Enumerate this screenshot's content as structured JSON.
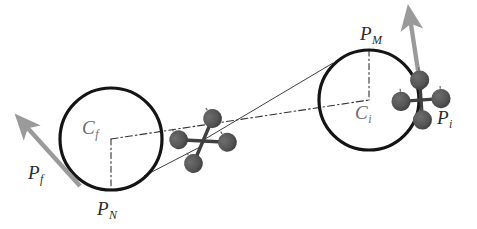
{
  "figure": {
    "background_color": "#ffffff",
    "stroke_color": "#1a1a1a",
    "arrow_color": "#9a9a9a",
    "rotor_color": "#555555",
    "label_color": "#2b2b2b"
  },
  "labels": {
    "c_f": {
      "base": "C",
      "sub": "f"
    },
    "p_f": {
      "base": "P",
      "sub": "f"
    },
    "p_n": {
      "base": "P",
      "sub": "N"
    },
    "p_m": {
      "base": "P",
      "sub": "M"
    },
    "c_i": {
      "base": "C",
      "sub": "i"
    },
    "p_i": {
      "base": "P",
      "sub": "i"
    }
  },
  "geometry": {
    "circle_final": {
      "cx": 111,
      "cy": 139,
      "r": 51,
      "label": "final turn circle"
    },
    "circle_initial": {
      "cx": 369,
      "cy": 100,
      "r": 50,
      "label": "initial turn circle"
    },
    "point_p_n": {
      "x": 111,
      "y": 190
    },
    "point_p_m": {
      "x": 369,
      "y": 50
    },
    "tangent_upper": {
      "x1": 203,
      "y1": 141,
      "x2": 330,
      "y2": 66
    },
    "tangent_lower": {
      "x1": 203,
      "y1": 141,
      "x2": 148,
      "y2": 174
    },
    "centerline": {
      "x1": 111,
      "y1": 139,
      "x2": 369,
      "y2": 100
    }
  },
  "quadcopters": [
    {
      "name": "quad-final",
      "cx": 203,
      "cy": 141,
      "rotation": -32,
      "scale": 1.0
    },
    {
      "name": "quad-initial",
      "cx": 421,
      "cy": 100,
      "rotation": -4,
      "scale": 1.0
    }
  ],
  "arrows": [
    {
      "name": "arrow-p-f",
      "x1": 80,
      "y1": 186,
      "x2": 19,
      "y2": 119,
      "color": "#9a9a9a"
    },
    {
      "name": "arrow-p-i",
      "x1": 420,
      "y1": 88,
      "x2": 409,
      "y2": 11,
      "color": "#9a9a9a"
    }
  ]
}
